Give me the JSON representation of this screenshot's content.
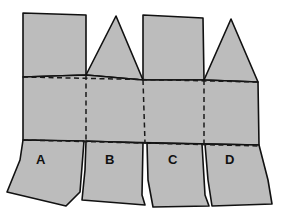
{
  "diagram": {
    "type": "paper-net",
    "colors": {
      "fill": "#bcbcbc",
      "line": "#111111",
      "background": "#ffffff"
    },
    "top_panels": [
      {
        "id": "panel-1",
        "shape": "rectangle"
      },
      {
        "id": "panel-2",
        "shape": "triangle"
      },
      {
        "id": "panel-3",
        "shape": "rectangle"
      },
      {
        "id": "panel-4",
        "shape": "triangle"
      }
    ],
    "fold_lines": {
      "style": "dashed",
      "count_horizontal": 2,
      "count_vertical": 3
    },
    "flaps": [
      {
        "id": "A",
        "label": "A"
      },
      {
        "id": "B",
        "label": "B"
      },
      {
        "id": "C",
        "label": "C"
      },
      {
        "id": "D",
        "label": "D"
      }
    ]
  }
}
